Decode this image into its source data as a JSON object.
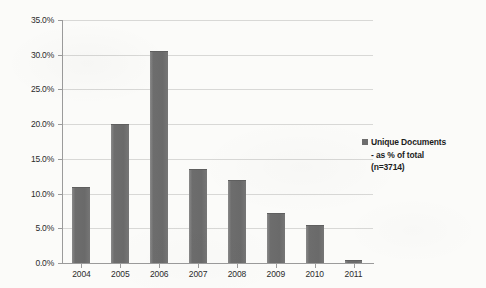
{
  "chart_data": {
    "type": "bar",
    "title": "",
    "xlabel": "",
    "ylabel": "",
    "categories": [
      "2004",
      "2005",
      "2006",
      "2007",
      "2008",
      "2009",
      "2010",
      "2011"
    ],
    "values": [
      11.0,
      20.0,
      30.6,
      13.5,
      11.9,
      7.2,
      5.5,
      0.5
    ],
    "value_labels": [
      "11.0%",
      "20.0%",
      "30.6%",
      "13.5%",
      "11.9%",
      "7.2%",
      "5.5%",
      "0.5%"
    ],
    "ylim": [
      0,
      35
    ],
    "ytick_values": [
      0,
      5,
      10,
      15,
      20,
      25,
      30,
      35
    ],
    "ytick_labels": [
      "0.0%",
      "5.0%",
      "10.0%",
      "15.0%",
      "20.0%",
      "25.0%",
      "30.0%",
      "35.0%"
    ],
    "grid": true,
    "legend_position": "right",
    "series": [
      {
        "name": "Unique Documents - as % of total (n=3714)",
        "color": "#6d6d6d",
        "values": [
          11.0,
          20.0,
          30.6,
          13.5,
          11.9,
          7.2,
          5.5,
          0.5
        ]
      }
    ]
  },
  "legend": {
    "swatch_color": "#6d6d6d",
    "line1": "Unique Documents",
    "line2": "- as % of total",
    "line3": "(n=3714)"
  }
}
